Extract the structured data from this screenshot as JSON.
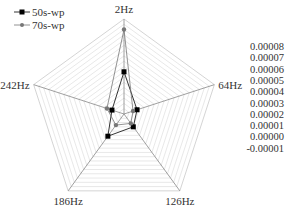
{
  "chart_data": {
    "type": "radar",
    "title": "",
    "axes": [
      "2Hz",
      "64Hz",
      "126Hz",
      "186Hz",
      "242Hz"
    ],
    "radial_ticks": [
      "0.00008",
      "0.00007",
      "0.00006",
      "0.00005",
      "0.00004",
      "0.00003",
      "0.00002",
      "0.00001",
      "0.00000",
      "-0.00001"
    ],
    "rlim": [
      -1e-05,
      8e-05
    ],
    "grid": true,
    "legend_position": "top-left",
    "series": [
      {
        "name": "50s-wp",
        "marker": "square",
        "color": "#000000",
        "values": [
          3e-05,
          3e-06,
          5e-06,
          1.6e-05,
          2e-06
        ]
      },
      {
        "name": "70s-wp",
        "marker": "circle",
        "color": "#777777",
        "values": [
          7e-05,
          -1e-06,
          1e-06,
          3e-06,
          7e-06
        ]
      }
    ]
  },
  "legend": {
    "items": [
      {
        "label": "50s-wp",
        "color": "#000000"
      },
      {
        "label": "70s-wp",
        "color": "#777777"
      }
    ]
  },
  "colors": {
    "grid": "#d8d8d8",
    "axis": "#888888",
    "text": "#333333"
  }
}
